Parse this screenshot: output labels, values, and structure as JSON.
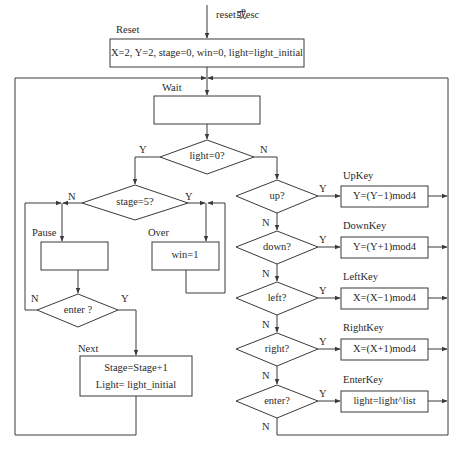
{
  "diagram": {
    "type": "flowchart",
    "entry_label": "reset或esc",
    "colors": {
      "line": "#3a3a3a",
      "text": "#2a2a2a",
      "background": "#ffffff"
    },
    "states": {
      "reset": {
        "name": "Reset",
        "action": "X=2, Y=2, stage=0, win=0, light=light_initial"
      },
      "wait": {
        "name": "Wait",
        "action": ""
      },
      "pause": {
        "name": "Pause",
        "action": ""
      },
      "over": {
        "name": "Over",
        "action": "win=1"
      },
      "next": {
        "name": "Next",
        "action_line1": "Stage=Stage+1",
        "action_line2": "Light= light_initial"
      },
      "upkey": {
        "name": "UpKey",
        "action": "Y=(Y−1)mod4"
      },
      "downkey": {
        "name": "DownKey",
        "action": "Y=(Y+1)mod4"
      },
      "leftkey": {
        "name": "LeftKey",
        "action": "X=(X−1)mod4"
      },
      "rightkey": {
        "name": "RightKey",
        "action": "X=(X+1)mod4"
      },
      "enterkey": {
        "name": "EnterKey",
        "action": "light=light^list"
      }
    },
    "decisions": {
      "light_zero": {
        "label": "light=0?",
        "yes": "Y",
        "no": "N"
      },
      "stage_five": {
        "label": "stage=5?",
        "yes": "Y",
        "no": "N"
      },
      "pause_enter": {
        "label": "enter ?",
        "yes": "Y",
        "no": "N"
      },
      "up": {
        "label": "up?",
        "yes": "Y",
        "no": "N"
      },
      "down": {
        "label": "down?",
        "yes": "Y",
        "no": "N"
      },
      "left": {
        "label": "left?",
        "yes": "Y",
        "no": "N"
      },
      "right": {
        "label": "right?",
        "yes": "Y",
        "no": "N"
      },
      "enter": {
        "label": "enter?",
        "yes": "Y",
        "no": "N"
      }
    }
  }
}
